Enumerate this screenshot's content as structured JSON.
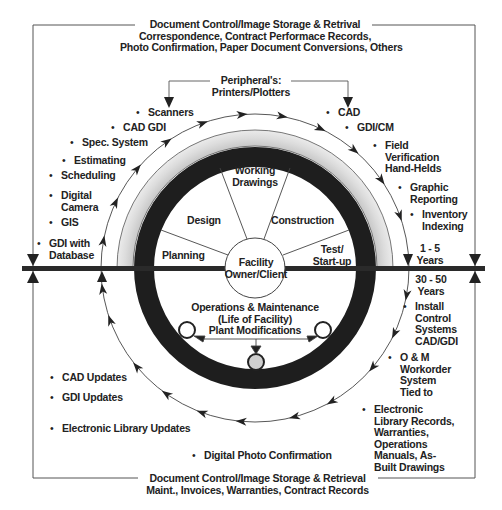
{
  "top_header": {
    "line1": "Document Control/Image Storage & Retrival",
    "line2": "Correspondence, Contract Performace Records,",
    "line3": "Photo Confirmation, Paper Document Conversions, Others"
  },
  "bottom_header": {
    "line1": "Document Control/Image Storage & Retrieval",
    "line2": "Maint., Invoices, Warranties, Contract Records"
  },
  "peripherals": {
    "line1": "Peripheral's:",
    "line2": "Printers/Plotters"
  },
  "left_items": [
    {
      "lines": [
        "Scanners"
      ]
    },
    {
      "lines": [
        "CAD GDI"
      ]
    },
    {
      "lines": [
        "Spec. System"
      ]
    },
    {
      "lines": [
        "Estimating"
      ]
    },
    {
      "lines": [
        "Scheduling"
      ]
    },
    {
      "lines": [
        "Digital",
        "Camera"
      ]
    },
    {
      "lines": [
        "GIS"
      ]
    },
    {
      "lines": [
        "GDI with",
        "Database"
      ]
    }
  ],
  "right_items": [
    {
      "lines": [
        "CAD"
      ]
    },
    {
      "lines": [
        "GDI/CM"
      ]
    },
    {
      "lines": [
        "Field",
        "Verification",
        "Hand-Helds"
      ]
    },
    {
      "lines": [
        "Graphic",
        "Reporting"
      ]
    },
    {
      "lines": [
        "Inventory",
        "Indexing"
      ]
    }
  ],
  "timeline": {
    "short": [
      "1 - 5",
      "Years"
    ],
    "long": [
      "30 - 50",
      "Years"
    ]
  },
  "lower_right_items": [
    {
      "lines": [
        "Install",
        "Control",
        "Systems",
        "CAD/GDI"
      ]
    },
    {
      "lines": [
        "O & M",
        "Workorder",
        "System",
        "Tied to"
      ]
    },
    {
      "lines": [
        "Electronic",
        "Library Records,",
        "Warranties,",
        "Operations",
        "Manuals, As-",
        "Built Drawings"
      ]
    }
  ],
  "lower_left_items": [
    {
      "lines": [
        "CAD Updates"
      ]
    },
    {
      "lines": [
        "GDI Updates"
      ]
    },
    {
      "lines": [
        "Electronic Library Updates"
      ]
    }
  ],
  "bottom_item": "Digital Photo Confirmation",
  "phases": {
    "working_drawings": [
      "Working",
      "Drawings"
    ],
    "design": "Design",
    "construction": "Construction",
    "planning": "Planning",
    "test_startup": [
      "Test/",
      "Start-up"
    ],
    "center": [
      "Facility",
      "Owner/Client"
    ]
  },
  "operations": {
    "line1": "Operations & Maintenance",
    "line2": "(Life of Facility)",
    "line3": "Plant Modifications"
  },
  "colors": {
    "ring": "#1e1e1e",
    "band": "#d0d0d0",
    "line": "#333333",
    "node_fill": "#cfcfcf"
  }
}
